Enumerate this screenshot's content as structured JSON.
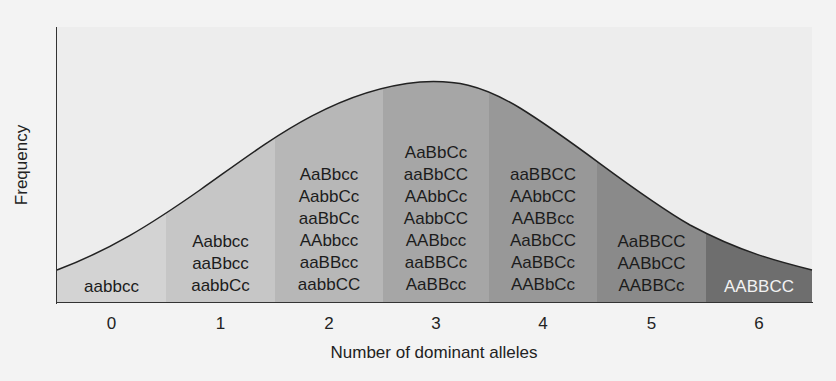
{
  "chart_data": {
    "type": "area",
    "title": "",
    "xlabel": "Number of dominant alleles",
    "ylabel": "Frequency",
    "categories": [
      "0",
      "1",
      "2",
      "3",
      "4",
      "5",
      "6"
    ],
    "values": [
      1,
      6,
      15,
      20,
      15,
      6,
      1
    ],
    "grid": false,
    "legend": "none",
    "curve": "normal distribution (bell curve) overlay",
    "genotypes": [
      [
        "aabbcc"
      ],
      [
        "Aabbcc",
        "aaBbcc",
        "aabbCc"
      ],
      [
        "AaBbcc",
        "AabbCc",
        "aaBbCc",
        "AAbbcc",
        "aaBBcc",
        "aabbCC"
      ],
      [
        "AaBbCc",
        "aaBbCC",
        "AAbbCc",
        "AabbCC",
        "AABbcc",
        "aaBBCc",
        "AaBBcc"
      ],
      [
        "aaBBCC",
        "AAbbCC",
        "AABBcc",
        "AaBbCC",
        "AaBBCc",
        "AABbCc"
      ],
      [
        "AaBBCC",
        "AABbCC",
        "AABBCc"
      ],
      [
        "AABBCC"
      ]
    ],
    "column_colors": [
      "#d3d3d3",
      "#c6c6c6",
      "#b7b7b7",
      "#a6a6a6",
      "#989898",
      "#8a8a8a",
      "#6e6e6e"
    ]
  },
  "axes": {
    "x_label": "Number of dominant alleles",
    "y_label": "Frequency",
    "ticks": [
      "0",
      "1",
      "2",
      "3",
      "4",
      "5",
      "6"
    ]
  },
  "columns": [
    {
      "count": "0",
      "genotypes": [
        "aabbcc"
      ]
    },
    {
      "count": "1",
      "genotypes": [
        "Aabbcc",
        "aaBbcc",
        "aabbCc"
      ]
    },
    {
      "count": "2",
      "genotypes": [
        "AaBbcc",
        "AabbCc",
        "aaBbCc",
        "AAbbcc",
        "aaBBcc",
        "aabbCC"
      ]
    },
    {
      "count": "3",
      "genotypes": [
        "AaBbCc",
        "aaBbCC",
        "AAbbCc",
        "AabbCC",
        "AABbcc",
        "aaBBCc",
        "AaBBcc"
      ]
    },
    {
      "count": "4",
      "genotypes": [
        "aaBBCC",
        "AAbbCC",
        "AABBcc",
        "AaBbCC",
        "AaBBCc",
        "AABbCc"
      ]
    },
    {
      "count": "5",
      "genotypes": [
        "AaBBCC",
        "AABbCC",
        "AABBCc"
      ]
    },
    {
      "count": "6",
      "genotypes": [
        "AABBCC"
      ]
    }
  ]
}
